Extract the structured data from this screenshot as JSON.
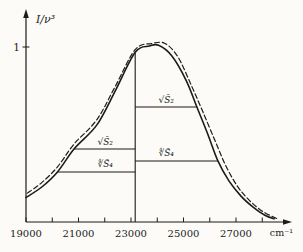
{
  "figure": {
    "background": "#fcfbf8",
    "ink": "#1b1b1b"
  },
  "chart_data": {
    "type": "line",
    "title": "",
    "xlabel": "cm⁻¹",
    "ylabel": "I/ν³",
    "y_reference_label": "1",
    "x_range": [
      19000,
      28600
    ],
    "y_range": [
      0,
      1.08
    ],
    "grid": false,
    "legend": "none",
    "x_tick_values": [
      19000,
      20000,
      21000,
      22000,
      23000,
      24000,
      25000,
      26000,
      27000,
      28000
    ],
    "x_ticks_labeled": [
      19000,
      21000,
      23000,
      25000,
      27000
    ],
    "series": [
      {
        "name": "observed-band",
        "style": "solid",
        "points": [
          [
            19000,
            0.14
          ],
          [
            19600,
            0.2
          ],
          [
            20200,
            0.286
          ],
          [
            20830,
            0.417
          ],
          [
            21700,
            0.555
          ],
          [
            22400,
            0.75
          ],
          [
            23160,
            0.97
          ],
          [
            23700,
            1.005
          ],
          [
            24050,
            1.01
          ],
          [
            24550,
            0.95
          ],
          [
            25100,
            0.81
          ],
          [
            25510,
            0.657
          ],
          [
            25930,
            0.5
          ],
          [
            26310,
            0.349
          ],
          [
            26730,
            0.235
          ],
          [
            27190,
            0.148
          ],
          [
            27650,
            0.085
          ],
          [
            28100,
            0.038
          ],
          [
            28450,
            0.018
          ]
        ]
      },
      {
        "name": "approximating-band",
        "style": "dashed",
        "points": [
          [
            19050,
            0.165
          ],
          [
            19600,
            0.225
          ],
          [
            20200,
            0.315
          ],
          [
            20830,
            0.445
          ],
          [
            21700,
            0.585
          ],
          [
            22400,
            0.775
          ],
          [
            23160,
            0.985
          ],
          [
            23800,
            1.02
          ],
          [
            24300,
            1.02
          ],
          [
            24800,
            0.94
          ],
          [
            25300,
            0.78
          ],
          [
            25750,
            0.625
          ],
          [
            26200,
            0.465
          ],
          [
            26600,
            0.325
          ],
          [
            27050,
            0.205
          ],
          [
            27500,
            0.125
          ],
          [
            28000,
            0.062
          ],
          [
            28550,
            0.02
          ]
        ]
      }
    ],
    "mean_frequency_line": {
      "x": 23160,
      "top": 0.97
    },
    "moment_width_lines": [
      {
        "id": "left-sqrt-s2",
        "label": "√S̄₂",
        "y": 0.417,
        "x_from": 20830,
        "x_to": 23160,
        "side": "left"
      },
      {
        "id": "left-root4-s4",
        "label": "∜S̄₄",
        "y": 0.286,
        "x_from": 20200,
        "x_to": 23160,
        "side": "left"
      },
      {
        "id": "right-sqrt-s2",
        "label": "√S̄₂",
        "y": 0.657,
        "x_from": 23160,
        "x_to": 25510,
        "side": "right"
      },
      {
        "id": "right-root4-s4",
        "label": "∜S̄₄",
        "y": 0.349,
        "x_from": 23160,
        "x_to": 26310,
        "side": "right"
      }
    ]
  }
}
